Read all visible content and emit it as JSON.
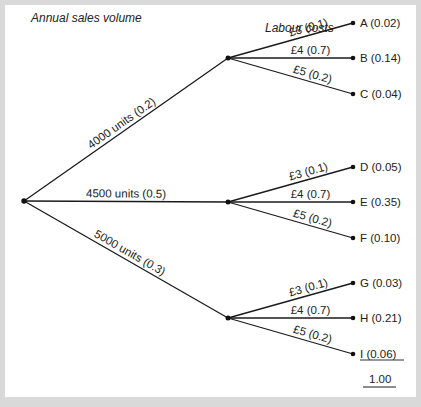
{
  "headers": {
    "sales_volume": "Annual sales volume",
    "labour_costs": "Labour costs"
  },
  "tree": {
    "first_level": [
      {
        "label": "4000 units (0.2)",
        "units": 4000,
        "probability": 0.2
      },
      {
        "label": "4500 units (0.5)",
        "units": 4500,
        "probability": 0.5
      },
      {
        "label": "5000 units (0.3)",
        "units": 5000,
        "probability": 0.3
      }
    ],
    "second_level_branches": [
      {
        "label": "£3 (0.1)",
        "cost": 3,
        "probability": 0.1
      },
      {
        "label": "£4 (0.7)",
        "cost": 4,
        "probability": 0.7
      },
      {
        "label": "£5 (0.2)",
        "cost": 5,
        "probability": 0.2
      }
    ],
    "outcomes": [
      {
        "id": "A",
        "label": "A (0.02)",
        "probability": 0.02
      },
      {
        "id": "B",
        "label": "B (0.14)",
        "probability": 0.14
      },
      {
        "id": "C",
        "label": "C (0.04)",
        "probability": 0.04
      },
      {
        "id": "D",
        "label": "D (0.05)",
        "probability": 0.05
      },
      {
        "id": "E",
        "label": "E (0.35)",
        "probability": 0.35
      },
      {
        "id": "F",
        "label": "F (0.10)",
        "probability": 0.1
      },
      {
        "id": "G",
        "label": "G (0.03)",
        "probability": 0.03
      },
      {
        "id": "H",
        "label": "H (0.21)",
        "probability": 0.21
      },
      {
        "id": "I",
        "label": "I (0.06)",
        "probability": 0.06
      }
    ],
    "total": "1.00"
  }
}
